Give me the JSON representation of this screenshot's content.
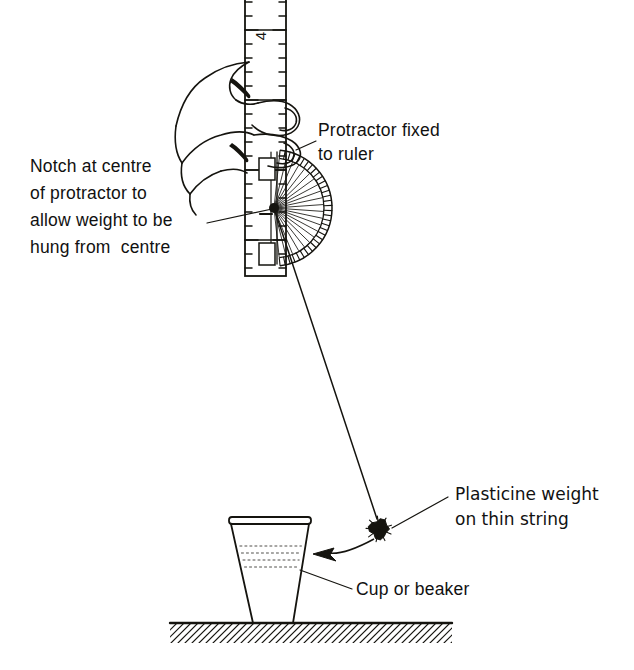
{
  "figure": {
    "background_color": "#ffffff",
    "ink_color": "#15140f",
    "width": 634,
    "height": 670
  },
  "labels": {
    "protractor_fixed": {
      "line1": "Protractor fixed",
      "line2": "to ruler",
      "x": 318,
      "y": 136
    },
    "notch": {
      "line1": "Notch at centre",
      "line2": "of protractor to",
      "line3": "allow weight to be",
      "line4": "hung from  centre",
      "x": 30,
      "y": 172
    },
    "plasticine": {
      "line1": "Plasticine weight",
      "line2": "on thin string",
      "x": 455,
      "y": 500
    },
    "cup": {
      "line1": "Cup or beaker",
      "x": 356,
      "y": 595
    }
  },
  "ruler": {
    "left_x": 245,
    "right_x": 286,
    "top_y": -6,
    "bottom_y": 276,
    "tick_spacing": 14,
    "short_tick_len": 7,
    "long_tick_len": 13,
    "number_label": "4",
    "number_x": 266,
    "number_y": 36,
    "number_rotation": -90
  },
  "protractor": {
    "center_x": 274,
    "center_y": 208,
    "inner_radius": 50,
    "outer_radius": 58,
    "radial_count": 21,
    "graduation_count": 33,
    "start_angle_deg": -84,
    "end_angle_deg": 84,
    "clip_top": {
      "x": 259,
      "y": 158,
      "w": 16,
      "h": 22
    },
    "clip_bottom": {
      "x": 259,
      "y": 243,
      "w": 16,
      "h": 22
    },
    "flat_edge_x": 277
  },
  "string": {
    "from_x": 274,
    "from_y": 208,
    "to_x": 377,
    "to_y": 519,
    "stroke_width": 1.5
  },
  "weight": {
    "center_x": 379,
    "center_y": 529,
    "radius": 11,
    "label": "plasticine-blob"
  },
  "arrow": {
    "tail_x": 374,
    "tail_y": 539,
    "tip_x": 313,
    "tip_y": 554,
    "head_size": 15
  },
  "cup": {
    "rim_left_x": 231,
    "rim_right_x": 309,
    "rim_y": 524,
    "base_left_x": 253,
    "base_right_x": 293,
    "base_y": 623,
    "rim_thickness": 7,
    "rib_count": 4,
    "rib_top_y": 546,
    "rib_spacing": 7
  },
  "ground": {
    "line_y": 623,
    "left_x": 170,
    "right_x": 452,
    "hatch_depth": 20,
    "hatch_spacing": 7
  },
  "leaders": {
    "notch_leader": {
      "x1": 207,
      "y1": 223,
      "x2": 272,
      "y2": 209
    },
    "protractor_leader": {
      "x1": 316,
      "y1": 141,
      "x2": 296,
      "y2": 150
    },
    "plasticine_leader": {
      "x1": 448,
      "y1": 497,
      "x2": 392,
      "y2": 528
    },
    "cup_leader": {
      "x1": 352,
      "y1": 589,
      "x2": 300,
      "y2": 570
    }
  }
}
